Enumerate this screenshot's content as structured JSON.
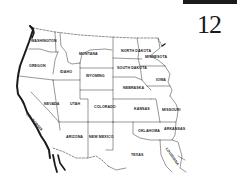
{
  "page": {
    "number": "12"
  },
  "map": {
    "title": "",
    "region": "Western and Central United States",
    "colors": {
      "line": "#1a1a1a",
      "background": "#ffffff"
    },
    "states": [
      {
        "id": "washington",
        "label": "WASHINGTON",
        "x": 31,
        "y": 41
      },
      {
        "id": "oregon",
        "label": "OREGON",
        "x": 29,
        "y": 65
      },
      {
        "id": "idaho",
        "label": "IDAHO",
        "x": 61,
        "y": 71
      },
      {
        "id": "montana",
        "label": "MONTANA",
        "x": 79,
        "y": 53
      },
      {
        "id": "wyoming",
        "label": "WYOMING",
        "x": 86,
        "y": 75
      },
      {
        "id": "north-dakota",
        "label": "NORTH DAKOTA",
        "x": 128,
        "y": 50
      },
      {
        "id": "south-dakota",
        "label": "SOUTH DAKOTA",
        "x": 126,
        "y": 67
      },
      {
        "id": "minnesota",
        "label": "MINNESOTA",
        "x": 146,
        "y": 56
      },
      {
        "id": "iowa",
        "label": "IOWA",
        "x": 158,
        "y": 79
      },
      {
        "id": "nebraska",
        "label": "NEBRASKA",
        "x": 125,
        "y": 88
      },
      {
        "id": "nevada",
        "label": "NEVADA",
        "x": 44,
        "y": 103
      },
      {
        "id": "utah",
        "label": "UTAH",
        "x": 70,
        "y": 103
      },
      {
        "id": "colorado",
        "label": "COLORADO",
        "x": 95,
        "y": 106
      },
      {
        "id": "kansas",
        "label": "KANSAS",
        "x": 135,
        "y": 108
      },
      {
        "id": "missouri",
        "label": "MISSOURI",
        "x": 164,
        "y": 109
      },
      {
        "id": "california",
        "label": "CALIFORNIA",
        "x": 30,
        "y": 113
      },
      {
        "id": "arizona",
        "label": "ARIZONA",
        "x": 66,
        "y": 136
      },
      {
        "id": "new-mexico",
        "label": "NEW MEXICO",
        "x": 89,
        "y": 136
      },
      {
        "id": "oklahoma",
        "label": "OKLAHOMA",
        "x": 139,
        "y": 130
      },
      {
        "id": "arkansas",
        "label": "ARKANSAS",
        "x": 165,
        "y": 128
      },
      {
        "id": "texas",
        "label": "TEXAS",
        "x": 131,
        "y": 154
      },
      {
        "id": "louisiana",
        "label": "LOUISIANA",
        "x": 172,
        "y": 152
      }
    ]
  }
}
